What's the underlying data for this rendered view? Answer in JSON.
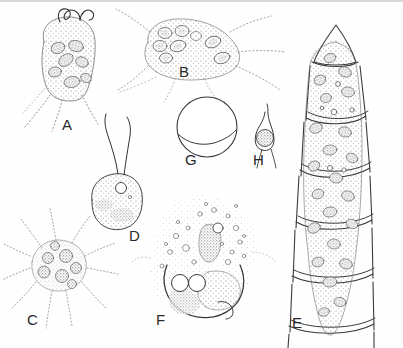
{
  "plate": {
    "title": "Plate of protist and algal microorganisms",
    "caption_style": "lettered line drawings",
    "background_color": "#fefefe",
    "ink_color": "#3a3a3a",
    "stipple_color": "#555555",
    "width": 403,
    "height": 348
  },
  "figures": [
    {
      "id": "A",
      "label": "A",
      "label_x": 62,
      "label_y": 117,
      "name": "biflagellate-pear-shaped-cell",
      "description": "Pear-shaped stippled cell with two long wavy flagella at the apex, several oval nuclei inside and tapering posterior processes",
      "flagella_count": 2,
      "nuclei_count": 7
    },
    {
      "id": "B",
      "label": "B",
      "label_x": 179,
      "label_y": 64,
      "name": "amoeboid-cell-with-pseudopodia",
      "description": "Broad stippled amoeboid body with several long radiating pseudopodia and a cluster of ring-shaped nuclei at the upper left",
      "pseudopodia_count": 6,
      "nuclei_count": 8
    },
    {
      "id": "C",
      "label": "C",
      "label_x": 27,
      "label_y": 312,
      "name": "radiate-star-shaped-cell",
      "description": "Star-shaped heliozoan-like cell with about eleven fine radiating axopodia and a granular centre containing several dark nuclei",
      "axopodia_count": 11,
      "nuclei_count": 7
    },
    {
      "id": "D",
      "label": "D",
      "label_x": 129,
      "label_y": 228,
      "name": "ovoid-biflagellate-zoospore",
      "description": "Small ovoid zoospore with two long flagella, a clear contractile vacuole near the apex and dense granular cytoplasm",
      "flagella_count": 2,
      "vacuole_count": 1
    },
    {
      "id": "E",
      "label": "E",
      "label_x": 292,
      "label_y": 315,
      "name": "segmented-filament-with-apical-cell",
      "description": "Upright filament of overlapping cell-wall segments with a conical apical cap, each segment enclosing stippled protoplasm with dark granular nuclei",
      "segment_count": 6,
      "nuclei_count": 22
    },
    {
      "id": "F",
      "label": "F",
      "label_x": 156,
      "label_y": 312,
      "name": "large-vacuolate-lobed-cell",
      "description": "Large rounded cell with lobed bumpy margin, numerous small vacuoles, an elongate granular body above and a bold internal arc enclosing two paired circles and a large stippled mass",
      "vacuole_count": 30,
      "paired_circles": 2
    },
    {
      "id": "G",
      "label": "G",
      "label_x": 185,
      "label_y": 152,
      "name": "spherical-cyst",
      "description": "Plain spherical cyst outlined in line only, crossed by a single curved division line below the equator",
      "division_lines": 1
    },
    {
      "id": "H",
      "label": "H",
      "label_x": 253,
      "label_y": 152,
      "name": "flask-shaped-cell-with-inner-sphere",
      "description": "Narrow flask or spindle-shaped cell drawn out into a slender neck, enclosing a stippled spherical body near its base",
      "inner_bodies": 1
    }
  ]
}
